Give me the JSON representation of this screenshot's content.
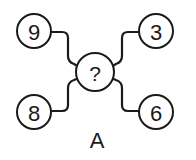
{
  "diagram": {
    "center": {
      "label": "?"
    },
    "nodes": [
      {
        "position": "top-left",
        "label": "9"
      },
      {
        "position": "top-right",
        "label": "3"
      },
      {
        "position": "bottom-left",
        "label": "8"
      },
      {
        "position": "bottom-right",
        "label": "6"
      }
    ],
    "caption": "A"
  }
}
